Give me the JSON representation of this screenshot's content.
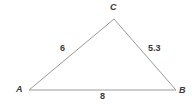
{
  "figure": {
    "type": "triangle-diagram",
    "background_color": "#ffffff",
    "stroke_color": "#999999",
    "text_color": "#3a3a3a",
    "stroke_width": 1
  },
  "vertices": [
    {
      "name": "A",
      "label": "A",
      "x": 29,
      "y": 90
    },
    {
      "name": "B",
      "label": "B",
      "x": 176,
      "y": 90
    },
    {
      "name": "C",
      "label": "C",
      "x": 114,
      "y": 19
    }
  ],
  "sides": [
    {
      "name": "AC",
      "label": "6",
      "value": 6
    },
    {
      "name": "CB",
      "label": "5.3",
      "value": 5.3
    },
    {
      "name": "AB",
      "label": "8",
      "value": 8
    }
  ],
  "chart_data": {
    "type": "diagram",
    "title": "",
    "shape": "triangle",
    "vertex_labels": [
      "A",
      "B",
      "C"
    ],
    "side_lengths": {
      "AC": 6,
      "CB": 5.3,
      "AB": 8
    },
    "side_label_texts": [
      "6",
      "5.3",
      "8"
    ],
    "points": {
      "A": [
        29,
        90
      ],
      "B": [
        176,
        90
      ],
      "C": [
        114,
        19
      ]
    }
  }
}
